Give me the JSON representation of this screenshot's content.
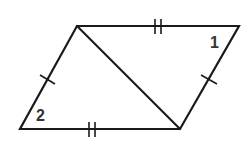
{
  "diagram": {
    "type": "parallelogram-with-diagonal",
    "colors": {
      "stroke": "#1a1a1a",
      "label": "#333333",
      "background": "#ffffff"
    },
    "vertices": {
      "top_left": [
        77,
        26
      ],
      "top_right": [
        239,
        26
      ],
      "bottom_right": [
        180,
        129
      ],
      "bottom_left": [
        20,
        129
      ]
    },
    "diagonal": {
      "from": "top_left",
      "to": "bottom_right"
    },
    "congruence_marks": [
      {
        "edge": "top",
        "ticks": 2
      },
      {
        "edge": "bottom",
        "ticks": 2
      },
      {
        "edge": "left",
        "ticks": 1
      },
      {
        "edge": "right",
        "ticks": 1
      }
    ],
    "angle_labels": [
      {
        "text": "1",
        "vertex": "top_right"
      },
      {
        "text": "2",
        "vertex": "bottom_left"
      }
    ]
  }
}
